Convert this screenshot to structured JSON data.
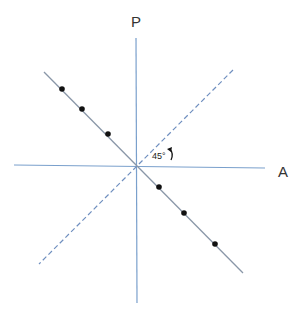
{
  "labels": {
    "vertical_axis": "P",
    "horizontal_axis": "A",
    "angle": "45°"
  },
  "colors": {
    "axis": "#7aa0cc",
    "solid_line": "#8a97a8",
    "dashed_line": "#6f8fbf",
    "dot": "#111111"
  },
  "geometry": {
    "vertical_axis": {
      "x1": 136,
      "y1": 38,
      "x2": 137,
      "y2": 303
    },
    "horizontal_axis": {
      "x1": 14,
      "y1": 165,
      "x2": 265,
      "y2": 168
    },
    "solid_diagonal": {
      "x1": 44,
      "y1": 72,
      "x2": 243,
      "y2": 273
    },
    "dashed_diagonal": {
      "x1": 233,
      "y1": 70,
      "x2": 39,
      "y2": 264
    },
    "dots": [
      {
        "x": 62,
        "y": 89
      },
      {
        "x": 82,
        "y": 109
      },
      {
        "x": 108,
        "y": 134
      },
      {
        "x": 159,
        "y": 187
      },
      {
        "x": 184,
        "y": 213
      },
      {
        "x": 215,
        "y": 244
      }
    ]
  }
}
